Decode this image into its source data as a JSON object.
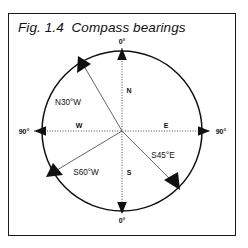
{
  "figure": {
    "caption": "Fig. 1.4  Compass bearings",
    "caption_number": "Fig. 1.4",
    "caption_title": "Compass bearings"
  },
  "diagram": {
    "type": "compass-rose",
    "center": {
      "x": 122,
      "y": 131
    },
    "radius": 80,
    "cardinal_labels": {
      "north": "N",
      "south": "S",
      "east": "E",
      "west": "W"
    },
    "angle_labels": {
      "top": "0°",
      "bottom": "0°",
      "left": "90°",
      "right": "90°"
    },
    "bearings": [
      {
        "label": "N30°W",
        "compass_deg": 330,
        "from": "N",
        "turn_deg": 30,
        "toward": "W"
      },
      {
        "label": "S60°W",
        "compass_deg": 240,
        "from": "S",
        "turn_deg": 60,
        "toward": "W"
      },
      {
        "label": "S45°E",
        "compass_deg": 135,
        "from": "S",
        "turn_deg": 45,
        "toward": "E"
      }
    ],
    "colors": {
      "outline": "#111111",
      "axis": "#4a4a4a",
      "ray": "#555555",
      "frame": "#1b1b1b",
      "background": "#ffffff"
    }
  }
}
